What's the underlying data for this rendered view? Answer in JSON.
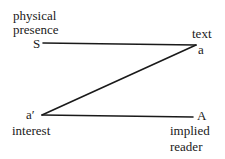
{
  "diagram": {
    "nodes": {
      "S": {
        "symbol": "S",
        "caption_lines": [
          "physical",
          "presence"
        ]
      },
      "a": {
        "symbol": "a",
        "caption_lines": [
          "text"
        ]
      },
      "a_prime": {
        "symbol": "a′",
        "caption_lines": [
          "interest"
        ]
      },
      "A": {
        "symbol": "A",
        "caption_lines": [
          "implied",
          "reader"
        ]
      }
    },
    "edges": [
      {
        "from": "S",
        "to": "a"
      },
      {
        "from": "a",
        "to": "a_prime"
      },
      {
        "from": "a_prime",
        "to": "A"
      }
    ],
    "colors": {
      "ink": "#1a1a1a",
      "background": "#ffffff"
    }
  }
}
